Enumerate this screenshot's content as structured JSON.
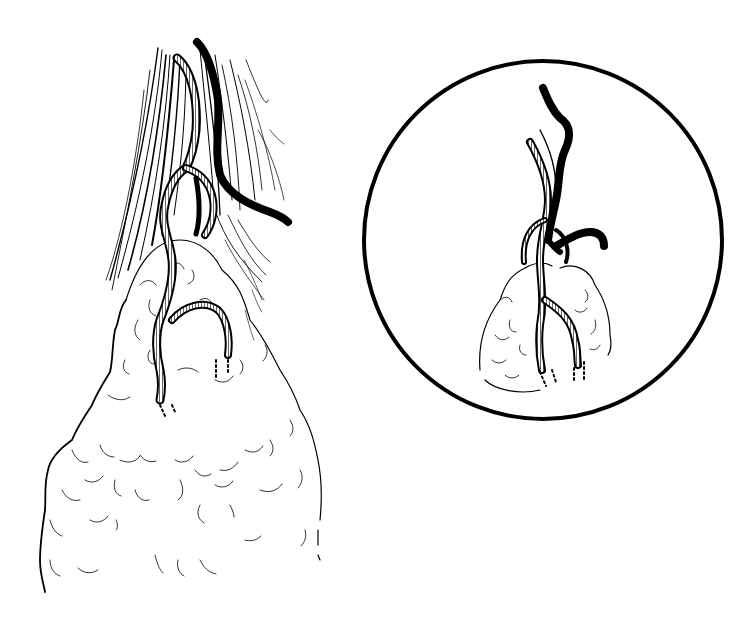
{
  "figure": {
    "type": "medical line illustration",
    "background_color": "#ffffff",
    "ink_color": "#000000",
    "panels": [
      {
        "id": "main-view",
        "description": "Vessel (hatched double-line) and nerve (thick black line) running down through fibrous tissue over a lobulated gland"
      },
      {
        "id": "circular-inset",
        "description": "Magnified inset in a circle showing vessel branches and nerve over a smaller lobulated gland"
      }
    ],
    "labels": []
  }
}
